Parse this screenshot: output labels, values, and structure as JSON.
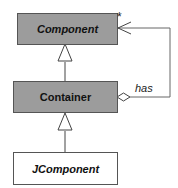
{
  "diagram": {
    "type": "uml-class",
    "classes": [
      {
        "id": "component",
        "name": "Component",
        "abstract": true,
        "fill": "#9c9c9c"
      },
      {
        "id": "container",
        "name": "Container",
        "abstract": false,
        "fill": "#9c9c9c"
      },
      {
        "id": "jcomponent",
        "name": "JComponent",
        "abstract": true,
        "fill": "#ffffff"
      }
    ],
    "relations": [
      {
        "type": "generalization",
        "from": "Container",
        "to": "Component"
      },
      {
        "type": "generalization",
        "from": "JComponent",
        "to": "Container"
      },
      {
        "type": "aggregation",
        "whole": "Container",
        "part": "Component",
        "label": "has",
        "multiplicity": "*"
      }
    ],
    "labels": {
      "association": "has",
      "multiplicity": "*"
    }
  }
}
